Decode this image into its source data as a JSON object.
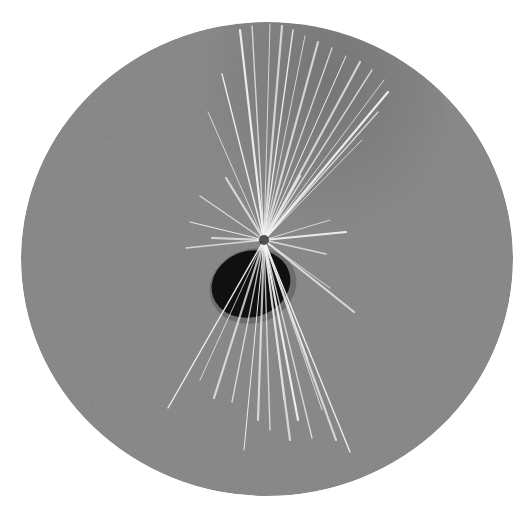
{
  "image": {
    "description": "Circular micrograph-style illustration: a dark oval body with a bundle of fine white radiating spines on a grainy gray field",
    "width": 530,
    "height": 511,
    "background_color": "#ffffff"
  },
  "field": {
    "shape": "ellipse",
    "cx": 267,
    "cy": 259,
    "rx": 246,
    "ry": 237,
    "base_color": "#8e8e8e",
    "edge_color": "#999999",
    "dark_patch_color": "#6e6e6e"
  },
  "body": {
    "shape": "ellipse",
    "cx": 251,
    "cy": 284,
    "rx": 40,
    "ry": 33,
    "rotate": -18,
    "color": "#101010"
  },
  "spine_origin": {
    "x": 264,
    "y": 240
  },
  "spine_color": "#f2f2f2",
  "spines": [
    [
      264,
      240,
      240,
      30
    ],
    [
      264,
      240,
      252,
      26
    ],
    [
      264,
      240,
      270,
      24
    ],
    [
      264,
      240,
      282,
      26
    ],
    [
      264,
      240,
      293,
      30
    ],
    [
      264,
      240,
      305,
      36
    ],
    [
      264,
      240,
      318,
      42
    ],
    [
      264,
      240,
      332,
      48
    ],
    [
      264,
      240,
      346,
      56
    ],
    [
      264,
      240,
      360,
      62
    ],
    [
      264,
      240,
      372,
      70
    ],
    [
      264,
      240,
      384,
      80
    ],
    [
      264,
      240,
      388,
      92
    ],
    [
      264,
      240,
      378,
      112
    ],
    [
      264,
      240,
      362,
      140
    ],
    [
      264,
      240,
      300,
      176
    ],
    [
      264,
      240,
      222,
      74
    ],
    [
      264,
      240,
      208,
      112
    ],
    [
      264,
      240,
      226,
      178
    ],
    [
      264,
      240,
      200,
      196
    ],
    [
      264,
      240,
      190,
      222
    ],
    [
      264,
      240,
      212,
      238
    ],
    [
      264,
      240,
      186,
      248
    ],
    [
      264,
      240,
      330,
      220
    ],
    [
      264,
      240,
      346,
      232
    ],
    [
      264,
      240,
      326,
      254
    ],
    [
      264,
      240,
      330,
      288
    ],
    [
      264,
      240,
      354,
      312
    ],
    [
      264,
      240,
      168,
      408
    ],
    [
      264,
      240,
      200,
      380
    ],
    [
      264,
      240,
      214,
      398
    ],
    [
      264,
      240,
      232,
      402
    ],
    [
      264,
      240,
      244,
      450
    ],
    [
      264,
      240,
      258,
      420
    ],
    [
      264,
      240,
      270,
      430
    ],
    [
      264,
      240,
      284,
      400
    ],
    [
      264,
      240,
      298,
      420
    ],
    [
      264,
      240,
      312,
      438
    ],
    [
      264,
      240,
      322,
      410
    ],
    [
      264,
      240,
      336,
      440
    ],
    [
      264,
      240,
      350,
      452
    ],
    [
      264,
      240,
      308,
      360
    ],
    [
      264,
      240,
      290,
      440
    ]
  ]
}
